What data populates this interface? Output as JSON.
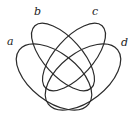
{
  "diagram": {
    "type": "four-set Venn diagram",
    "stroke_color": "#2b2b2b",
    "sets": [
      {
        "id": "a",
        "label": "a",
        "cx": 54,
        "cy": 77,
        "rx": 44,
        "ry": 24,
        "rotate": 38,
        "label_x": 7,
        "label_y": 36
      },
      {
        "id": "b",
        "label": "b",
        "cx": 63,
        "cy": 57,
        "rx": 42,
        "ry": 19,
        "rotate": 48,
        "label_x": 34,
        "label_y": 6
      },
      {
        "id": "c",
        "label": "c",
        "cx": 74,
        "cy": 57,
        "rx": 42,
        "ry": 19,
        "rotate": -48,
        "label_x": 92,
        "label_y": 6
      },
      {
        "id": "d",
        "label": "d",
        "cx": 83,
        "cy": 77,
        "rx": 44,
        "ry": 24,
        "rotate": -38,
        "label_x": 121,
        "label_y": 37
      }
    ]
  }
}
